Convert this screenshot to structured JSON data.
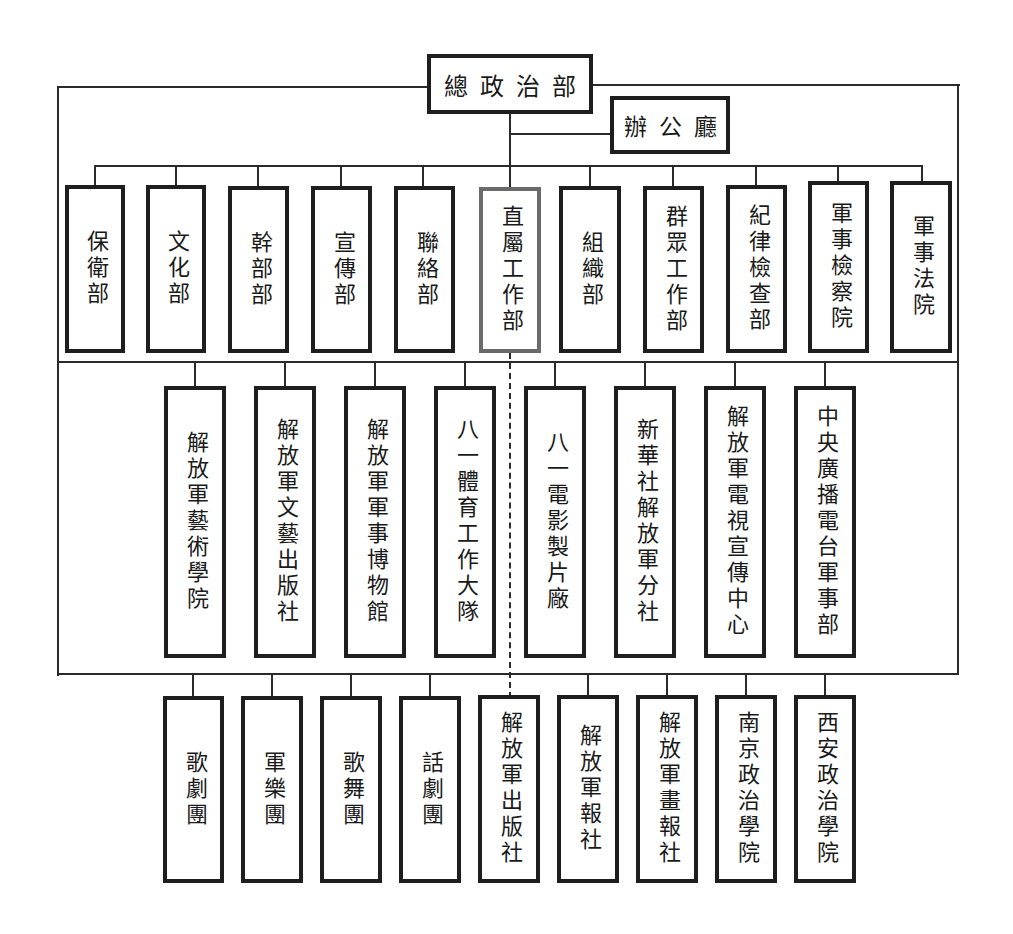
{
  "chart": {
    "root": {
      "label": "總政治部"
    },
    "office": {
      "label": "辦公廳"
    },
    "level1": [
      {
        "label": "保衛部",
        "x": 95
      },
      {
        "label": "文化部",
        "x": 176
      },
      {
        "label": "幹部部",
        "x": 258
      },
      {
        "label": "宣傳部",
        "x": 341
      },
      {
        "label": "聯絡部",
        "x": 423
      },
      {
        "label": "直屬工作部",
        "x": 510,
        "highlight": true
      },
      {
        "label": "組織部",
        "x": 590
      },
      {
        "label": "群眾工作部",
        "x": 673
      },
      {
        "label": "紀律檢查部",
        "x": 756
      },
      {
        "label": "軍事檢察院",
        "x": 838
      },
      {
        "label": "軍事法院",
        "x": 921
      }
    ],
    "level2": [
      {
        "label": "解放軍藝術學院",
        "x": 195
      },
      {
        "label": "解放軍文藝出版社",
        "x": 285
      },
      {
        "label": "解放軍軍事博物館",
        "x": 375
      },
      {
        "label": "八一體育工作大隊",
        "x": 465
      },
      {
        "label": "八一電影製片廠",
        "x": 555
      },
      {
        "label": "新華社解放軍分社",
        "x": 645
      },
      {
        "label": "解放軍電視宣傳中心",
        "x": 735
      },
      {
        "label": "中央廣播電台軍事部",
        "x": 825
      }
    ],
    "level3": [
      {
        "label": "歌劇團",
        "x": 193
      },
      {
        "label": "軍樂團",
        "x": 272
      },
      {
        "label": "歌舞團",
        "x": 351
      },
      {
        "label": "話劇團",
        "x": 430
      },
      {
        "label": "解放軍出版社",
        "x": 510
      },
      {
        "label": "解放軍報社",
        "x": 588
      },
      {
        "label": "解放軍畫報社",
        "x": 667
      },
      {
        "label": "南京政治學院",
        "x": 746
      },
      {
        "label": "西安政治學院",
        "x": 825
      }
    ]
  }
}
